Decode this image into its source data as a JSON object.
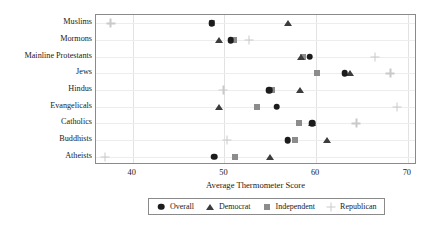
{
  "chart_data": {
    "type": "scatter",
    "title": "",
    "xlabel": "Average Thermometer Score",
    "ylabel": "",
    "xlim": [
      36,
      71
    ],
    "xticks": [
      40,
      50,
      60,
      70
    ],
    "xtick_labels": [
      "40",
      "50",
      "60",
      "70"
    ],
    "grid": true,
    "legend_position": "bottom",
    "categories": [
      "Muslims",
      "Mormons",
      "Mainline Protestants",
      "Jews",
      "Hindus",
      "Evangelicals",
      "Catholics",
      "Buddhists",
      "Atheists"
    ],
    "series": [
      {
        "name": "Overall",
        "marker": "circle",
        "color": "#1c1c1c",
        "values": [
          48.6,
          50.7,
          59.3,
          63.1,
          54.9,
          55.7,
          59.6,
          56.9,
          48.9
        ]
      },
      {
        "name": "Democrat",
        "marker": "triangle",
        "color": "#3c3c3c",
        "values": [
          56.9,
          49.4,
          58.3,
          63.7,
          58.2,
          49.4,
          59.6,
          61.2,
          55.0
        ]
      },
      {
        "name": "Independent",
        "marker": "square",
        "color": "#8c8c8c",
        "values": [
          48.6,
          51.1,
          58.6,
          60.1,
          55.2,
          53.6,
          58.1,
          57.7,
          51.2
        ]
      },
      {
        "name": "Republican",
        "marker": "cross",
        "color": "#c9c9c9",
        "values": [
          37.6,
          52.7,
          66.4,
          68.1,
          49.9,
          68.8,
          64.4,
          50.3,
          37.0
        ]
      }
    ]
  },
  "legend": {
    "entries": [
      {
        "label": "Overall"
      },
      {
        "label": "Democrat"
      },
      {
        "label": "Independent"
      },
      {
        "label": "Republican"
      }
    ]
  }
}
